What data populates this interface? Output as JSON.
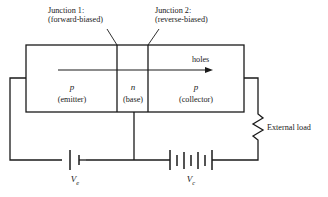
{
  "figure": {
    "junctions": [
      {
        "line1": "Junction 1:",
        "line2": "(forward-biased)"
      },
      {
        "line1": "Junction 2:",
        "line2": "(reverse-biased)"
      }
    ],
    "regions": [
      {
        "symbol": "p",
        "name": "(emitter)"
      },
      {
        "symbol": "n",
        "name": "(base)"
      },
      {
        "symbol": "p",
        "name": "(collector)"
      }
    ],
    "carrier_arrow_label": "holes",
    "load_label": "External load",
    "sources": [
      {
        "symbol": "V",
        "subscript": "e"
      },
      {
        "symbol": "V",
        "subscript": "c"
      }
    ],
    "colors": {
      "line": "#1a1a1a",
      "text": "#1a1a1a",
      "background": "#ffffff"
    }
  }
}
